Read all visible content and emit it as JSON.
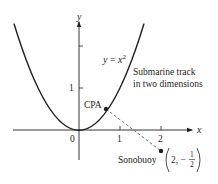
{
  "diagram": {
    "curve_label": {
      "lhs": "y",
      "eq": " = ",
      "base": "x",
      "exp": "2"
    },
    "track_label": [
      "Submarine track",
      "in two dimensions"
    ],
    "axes": {
      "x_label": "x",
      "y_label": "y",
      "origin_label": "0",
      "x_ticks": [
        "1",
        "2"
      ],
      "y_ticks": [
        "1"
      ]
    },
    "points": {
      "cpa": {
        "label": "CPA"
      },
      "sonobuoy": {
        "label": "Sonobuoy",
        "coord_x": "2",
        "coord_sep": ", ",
        "coord_minus": "−",
        "frac_num": "1",
        "frac_den": "2"
      }
    },
    "colors": {
      "ink": "#231f20",
      "curve": "#231f20",
      "dashed": "#555555"
    }
  }
}
